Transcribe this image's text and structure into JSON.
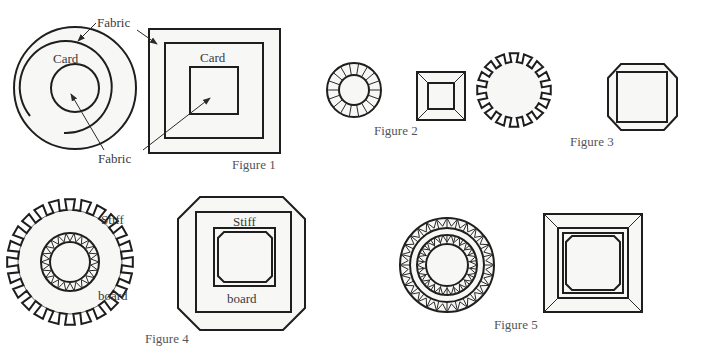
{
  "figure1": {
    "labels": {
      "fabric_top": "Fabric",
      "fabric_bottom": "Fabric",
      "card_circle": "Card",
      "card_square": "Card"
    },
    "caption": "Figure 1"
  },
  "figure2": {
    "caption": "Figure 2"
  },
  "figure3": {
    "caption": "Figure 3"
  },
  "figure4": {
    "labels": {
      "stiff_circle": "Stiff",
      "board_circle": "board",
      "stiff_square": "Stiff",
      "board_square": "board"
    },
    "caption": "Figure 4"
  },
  "figure5": {
    "caption": "Figure 5"
  },
  "colors": {
    "line": "#1e1e1e",
    "text": "#3a3a3a",
    "background": "#ffffff"
  }
}
